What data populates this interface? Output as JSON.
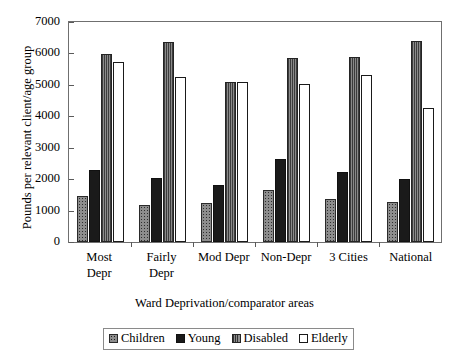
{
  "chart_data": {
    "type": "bar",
    "title": "",
    "xlabel": "Ward Deprivation/comparator areas",
    "ylabel": "Pounds per relevant client/age group",
    "categories": [
      "Most Depr",
      "Fairly Depr",
      "Mod Depr",
      "Non-Depr",
      "3 Cities",
      "National"
    ],
    "category_lines": [
      [
        "Most",
        "Depr"
      ],
      [
        "Fairly",
        "Depr"
      ],
      [
        "Mod Depr"
      ],
      [
        "Non-Depr"
      ],
      [
        "3 Cities"
      ],
      [
        "National"
      ]
    ],
    "series": [
      {
        "name": "Children",
        "values": [
          1480,
          1180,
          1250,
          1670,
          1370,
          1270
        ]
      },
      {
        "name": "Young",
        "values": [
          2300,
          2050,
          1830,
          2650,
          2220,
          2020
        ]
      },
      {
        "name": "Disabled",
        "values": [
          5980,
          6380,
          5080,
          5870,
          5900,
          6400
        ]
      },
      {
        "name": "Elderly",
        "values": [
          5720,
          5260,
          5080,
          5020,
          5300,
          4280
        ]
      }
    ],
    "ylim": [
      0,
      7000
    ],
    "yticks": [
      0,
      1000,
      2000,
      3000,
      4000,
      5000,
      6000,
      7000
    ],
    "ytick_labels": [
      "0",
      "1000",
      "2000",
      "3000",
      "4000",
      "5000",
      "6000",
      "7000"
    ],
    "grid": false,
    "legend_position": "bottom",
    "legend_entries": [
      "Children",
      "Young",
      "Disabled",
      "Elderly"
    ],
    "colors": {
      "children": "#8d8d8d",
      "young": "#1a1a1a",
      "disabled": "#737373",
      "elderly": "#ffffff",
      "axis": "#5a5a5a",
      "frame": "#6f6f6f"
    }
  }
}
